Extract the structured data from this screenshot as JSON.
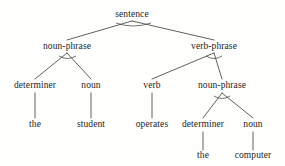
{
  "diagram": {
    "type": "syntax-parse-tree",
    "sentence": "the student operates the computer",
    "line_color": "#3a3a3a",
    "text_color": "#1d1d1d",
    "background_color": "#fefefd",
    "nodes": [
      {
        "id": "sentence",
        "label": "sentence",
        "x": 132,
        "y": 18,
        "level": 0,
        "kind": "nonterminal"
      },
      {
        "id": "np1",
        "label": "noun-phrase",
        "x": 67,
        "y": 50,
        "level": 1,
        "kind": "nonterminal"
      },
      {
        "id": "vp",
        "label": "verb-phrase",
        "x": 214,
        "y": 50,
        "level": 1,
        "kind": "nonterminal"
      },
      {
        "id": "det1",
        "label": "determiner",
        "x": 35,
        "y": 89,
        "level": 2,
        "kind": "nonterminal"
      },
      {
        "id": "noun1",
        "label": "noun",
        "x": 91,
        "y": 89,
        "level": 2,
        "kind": "nonterminal"
      },
      {
        "id": "verb",
        "label": "verb",
        "x": 152,
        "y": 89,
        "level": 2,
        "kind": "nonterminal"
      },
      {
        "id": "np2",
        "label": "noun-phrase",
        "x": 222,
        "y": 89,
        "level": 2,
        "kind": "nonterminal"
      },
      {
        "id": "the1",
        "label": "the",
        "x": 35,
        "y": 128,
        "level": 3,
        "kind": "terminal"
      },
      {
        "id": "student",
        "label": "student",
        "x": 91,
        "y": 128,
        "level": 3,
        "kind": "terminal"
      },
      {
        "id": "operates",
        "label": "operates",
        "x": 152,
        "y": 128,
        "level": 3,
        "kind": "terminal"
      },
      {
        "id": "det2",
        "label": "determiner",
        "x": 203,
        "y": 128,
        "level": 3,
        "kind": "nonterminal"
      },
      {
        "id": "noun2",
        "label": "noun",
        "x": 253,
        "y": 128,
        "level": 3,
        "kind": "nonterminal"
      },
      {
        "id": "the2",
        "label": "the",
        "x": 203,
        "y": 159,
        "level": 4,
        "kind": "terminal"
      },
      {
        "id": "computer",
        "label": "computer",
        "x": 253,
        "y": 159,
        "level": 4,
        "kind": "terminal"
      }
    ],
    "edges": [
      {
        "from": "sentence",
        "to": "np1",
        "x1": 132,
        "y1": 21,
        "x2": 67,
        "y2": 40
      },
      {
        "from": "sentence",
        "to": "vp",
        "x1": 132,
        "y1": 21,
        "x2": 214,
        "y2": 40
      },
      {
        "from": "np1",
        "to": "det1",
        "x1": 67,
        "y1": 53,
        "x2": 35,
        "y2": 79
      },
      {
        "from": "np1",
        "to": "noun1",
        "x1": 67,
        "y1": 53,
        "x2": 91,
        "y2": 79
      },
      {
        "from": "vp",
        "to": "verb",
        "x1": 214,
        "y1": 53,
        "x2": 152,
        "y2": 79
      },
      {
        "from": "vp",
        "to": "np2",
        "x1": 214,
        "y1": 53,
        "x2": 222,
        "y2": 79
      },
      {
        "from": "det1",
        "to": "the1",
        "x1": 35,
        "y1": 93,
        "x2": 35,
        "y2": 118
      },
      {
        "from": "noun1",
        "to": "student",
        "x1": 91,
        "y1": 93,
        "x2": 91,
        "y2": 118
      },
      {
        "from": "verb",
        "to": "operates",
        "x1": 152,
        "y1": 93,
        "x2": 152,
        "y2": 118
      },
      {
        "from": "np2",
        "to": "det2",
        "x1": 222,
        "y1": 93,
        "x2": 203,
        "y2": 118
      },
      {
        "from": "np2",
        "to": "noun2",
        "x1": 222,
        "y1": 93,
        "x2": 253,
        "y2": 118
      },
      {
        "from": "det2",
        "to": "the2",
        "x1": 203,
        "y1": 132,
        "x2": 203,
        "y2": 150
      },
      {
        "from": "noun2",
        "to": "computer",
        "x1": 253,
        "y1": 132,
        "x2": 253,
        "y2": 150
      }
    ],
    "arcs": [
      {
        "at": "sentence",
        "x1": 116,
        "y1": 23,
        "cx": 133,
        "cy": 29,
        "x2": 151,
        "y2": 23
      },
      {
        "at": "np1",
        "x1": 59,
        "y1": 56,
        "cx": 67,
        "cy": 61,
        "x2": 76,
        "y2": 56
      },
      {
        "at": "vp",
        "x1": 206,
        "y1": 56,
        "cx": 214,
        "cy": 61,
        "x2": 222,
        "y2": 56
      },
      {
        "at": "np2",
        "x1": 214,
        "y1": 96,
        "cx": 222,
        "cy": 101,
        "x2": 230,
        "y2": 96
      }
    ]
  }
}
